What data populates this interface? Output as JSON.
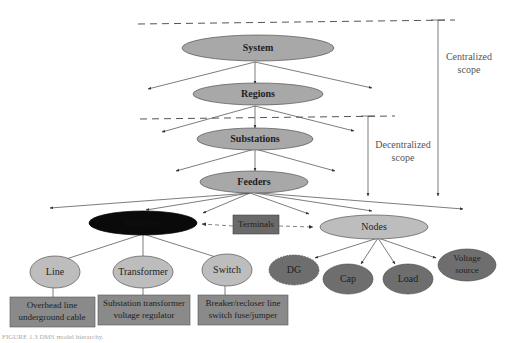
{
  "colors": {
    "level_node": "#a8a8a8",
    "light_node": "#bdbdbd",
    "dark_node": "#6e6e6e",
    "black_node": "#0a0a0a",
    "box": "#8a8a8a",
    "terminal_box": "#6a6a6a"
  },
  "hierarchy": {
    "system": "System",
    "regions": "Regions",
    "substations": "Substations",
    "feeders": "Feeders",
    "branches": "Branches",
    "terminals": "Terminals",
    "nodes": "Nodes"
  },
  "branch_types": {
    "line": "Line",
    "transformer": "Transformer",
    "switch": "Switch"
  },
  "branch_examples": {
    "line": [
      "Overhead line",
      "underground cable"
    ],
    "transformer": [
      "Substation transformer",
      "voltage regulator"
    ],
    "switch": [
      "Breaker/recloser line",
      "switch fuse/jumper"
    ]
  },
  "node_types": {
    "dg": "DG",
    "cap": "Cap",
    "load": "Load",
    "voltage_source": [
      "Voltage",
      "source"
    ]
  },
  "scopes": {
    "centralized": [
      "Centralized",
      "scope"
    ],
    "decentralized": [
      "Decentralized",
      "scope"
    ]
  },
  "caption": "FIGURE 1.3  DMS model hierarchy."
}
